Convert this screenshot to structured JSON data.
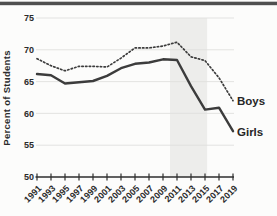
{
  "chart_data": {
    "type": "line",
    "title": "",
    "ylabel": "Percent of Students",
    "xlabel": "",
    "x": [
      1991,
      1993,
      1995,
      1997,
      1999,
      2001,
      2003,
      2005,
      2007,
      2009,
      2011,
      2013,
      2015,
      2017,
      2019
    ],
    "x_tick_labels": [
      "1991",
      "1993",
      "1995",
      "1997",
      "1999",
      "2001",
      "2003",
      "2005",
      "2007",
      "2009",
      "2011",
      "2013",
      "2015",
      "2017",
      "2019"
    ],
    "yticks": [
      50,
      55,
      60,
      65,
      70,
      75
    ],
    "ylim": [
      50,
      75
    ],
    "xlim": [
      1991,
      2019
    ],
    "grid": true,
    "legend_position": "right-end-of-line-labels",
    "highlight_band": {
      "x_start": 2010,
      "x_end": 2015.3
    },
    "series": [
      {
        "name": "Boys",
        "line_style": "dotted",
        "values": [
          68.6,
          67.5,
          66.7,
          67.4,
          67.4,
          67.3,
          68.7,
          70.3,
          70.3,
          70.6,
          71.2,
          68.9,
          68.3,
          65.6,
          62.0
        ]
      },
      {
        "name": "Girls",
        "line_style": "solid",
        "values": [
          66.2,
          66.0,
          64.7,
          64.9,
          65.1,
          65.9,
          67.1,
          67.8,
          68.0,
          68.5,
          68.4,
          64.3,
          60.6,
          60.9,
          57.2
        ]
      }
    ],
    "colors": {
      "line": "#3c3c3c",
      "grid": "#e0e0de",
      "band": "#ededeb",
      "axis": "#2e2e2e",
      "text": "#2b2b2b",
      "background": "#fcfcfb",
      "top_border": "#4f4f4f"
    }
  }
}
